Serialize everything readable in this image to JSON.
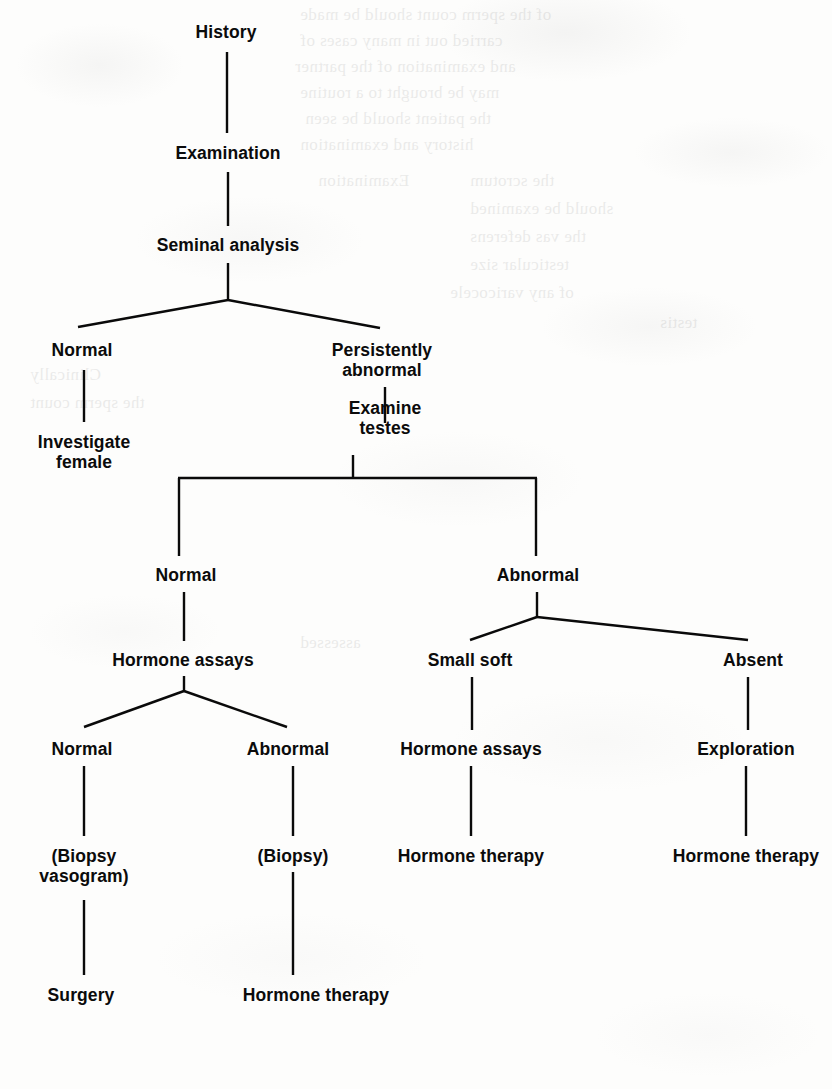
{
  "page": {
    "width": 832,
    "height": 1089,
    "background_color": "#fdfdfc",
    "ink_color": "#0b0b0b"
  },
  "diagram": {
    "type": "flowchart",
    "orientation": "top-down tree",
    "nodes": [
      {
        "id": "history",
        "label": "History",
        "x": 226,
        "y": 22,
        "lines": 1
      },
      {
        "id": "examination",
        "label": "Examination",
        "x": 228,
        "y": 143,
        "lines": 1
      },
      {
        "id": "seminal-analysis",
        "label": "Seminal analysis",
        "x": 228,
        "y": 235,
        "lines": 1
      },
      {
        "id": "sa-normal",
        "label": "Normal",
        "x": 82,
        "y": 340,
        "lines": 1
      },
      {
        "id": "sa-persist-abnormal",
        "label": "Persistently\nabnormal",
        "x": 382,
        "y": 340,
        "lines": 2
      },
      {
        "id": "investigate-female",
        "label": "Investigate\nfemale",
        "x": 84,
        "y": 432,
        "lines": 2
      },
      {
        "id": "examine-testes",
        "label": "Examine\ntestes",
        "x": 385,
        "y": 398,
        "lines": 2
      },
      {
        "id": "testes-normal",
        "label": "Normal",
        "x": 186,
        "y": 565,
        "lines": 1
      },
      {
        "id": "testes-abnormal",
        "label": "Abnormal",
        "x": 538,
        "y": 565,
        "lines": 1
      },
      {
        "id": "hormone-assays-1",
        "label": "Hormone assays",
        "x": 183,
        "y": 650,
        "lines": 1
      },
      {
        "id": "small-soft",
        "label": "Small soft",
        "x": 470,
        "y": 650,
        "lines": 1
      },
      {
        "id": "absent",
        "label": "Absent",
        "x": 753,
        "y": 650,
        "lines": 1
      },
      {
        "id": "ha-normal",
        "label": "Normal",
        "x": 82,
        "y": 739,
        "lines": 1
      },
      {
        "id": "ha-abnormal",
        "label": "Abnormal",
        "x": 288,
        "y": 739,
        "lines": 1
      },
      {
        "id": "hormone-assays-2",
        "label": "Hormone assays",
        "x": 471,
        "y": 739,
        "lines": 1
      },
      {
        "id": "exploration",
        "label": "Exploration",
        "x": 746,
        "y": 739,
        "lines": 1
      },
      {
        "id": "biopsy-vasogram",
        "label": "(Biopsy\nvasogram)",
        "x": 84,
        "y": 846,
        "lines": 2
      },
      {
        "id": "biopsy",
        "label": "(Biopsy)",
        "x": 293,
        "y": 846,
        "lines": 1
      },
      {
        "id": "hormone-therapy-1",
        "label": "Hormone therapy",
        "x": 471,
        "y": 846,
        "lines": 1
      },
      {
        "id": "hormone-therapy-2",
        "label": "Hormone therapy",
        "x": 746,
        "y": 846,
        "lines": 1
      },
      {
        "id": "surgery",
        "label": "Surgery",
        "x": 81,
        "y": 985,
        "lines": 1
      },
      {
        "id": "hormone-therapy-3",
        "label": "Hormone therapy",
        "x": 316,
        "y": 985,
        "lines": 1
      }
    ],
    "edges": [
      {
        "from": "history",
        "to": "examination",
        "style": "vertical"
      },
      {
        "from": "examination",
        "to": "seminal-analysis",
        "style": "vertical"
      },
      {
        "from": "seminal-analysis",
        "to": "sa-normal",
        "style": "diagonal"
      },
      {
        "from": "seminal-analysis",
        "to": "sa-persist-abnormal",
        "style": "diagonal"
      },
      {
        "from": "sa-normal",
        "to": "investigate-female",
        "style": "vertical"
      },
      {
        "from": "sa-persist-abnormal",
        "to": "examine-testes",
        "style": "vertical"
      },
      {
        "from": "examine-testes",
        "to": "testes-normal",
        "style": "orthogonal"
      },
      {
        "from": "examine-testes",
        "to": "testes-abnormal",
        "style": "orthogonal"
      },
      {
        "from": "testes-normal",
        "to": "hormone-assays-1",
        "style": "vertical"
      },
      {
        "from": "testes-abnormal",
        "to": "small-soft",
        "style": "diagonal"
      },
      {
        "from": "testes-abnormal",
        "to": "absent",
        "style": "diagonal"
      },
      {
        "from": "hormone-assays-1",
        "to": "ha-normal",
        "style": "diagonal"
      },
      {
        "from": "hormone-assays-1",
        "to": "ha-abnormal",
        "style": "diagonal"
      },
      {
        "from": "small-soft",
        "to": "hormone-assays-2",
        "style": "vertical"
      },
      {
        "from": "absent",
        "to": "exploration",
        "style": "vertical"
      },
      {
        "from": "ha-normal",
        "to": "biopsy-vasogram",
        "style": "vertical"
      },
      {
        "from": "ha-abnormal",
        "to": "biopsy",
        "style": "vertical"
      },
      {
        "from": "hormone-assays-2",
        "to": "hormone-therapy-1",
        "style": "vertical"
      },
      {
        "from": "exploration",
        "to": "hormone-therapy-2",
        "style": "vertical"
      },
      {
        "from": "biopsy-vasogram",
        "to": "surgery",
        "style": "vertical"
      },
      {
        "from": "biopsy",
        "to": "hormone-therapy-3",
        "style": "vertical"
      }
    ]
  },
  "bleed_through": {
    "note": "faint mirrored text showing through from the reverse side of the page",
    "fragments": [
      {
        "x": 300,
        "y": 2,
        "text": "of the sperm count should be made"
      },
      {
        "x": 300,
        "y": 28,
        "text": "carried out in many cases of"
      },
      {
        "x": 295,
        "y": 54,
        "text": "and examination of the partner"
      },
      {
        "x": 300,
        "y": 80,
        "text": "may be brought to a routine"
      },
      {
        "x": 305,
        "y": 106,
        "text": "the patient should be seen"
      },
      {
        "x": 300,
        "y": 132,
        "text": "history and examination"
      },
      {
        "x": 318,
        "y": 168,
        "text": "Examination"
      },
      {
        "x": 470,
        "y": 168,
        "text": "the scrotum"
      },
      {
        "x": 470,
        "y": 196,
        "text": "should be examined"
      },
      {
        "x": 470,
        "y": 224,
        "text": "the vas deferens"
      },
      {
        "x": 470,
        "y": 252,
        "text": "testicular size"
      },
      {
        "x": 450,
        "y": 280,
        "text": "of any varicocele"
      },
      {
        "x": 660,
        "y": 310,
        "text": "testis"
      },
      {
        "x": 30,
        "y": 362,
        "text": "Clinically"
      },
      {
        "x": 30,
        "y": 390,
        "text": "the sperm count"
      },
      {
        "x": 300,
        "y": 630,
        "text": "assessed"
      }
    ]
  }
}
